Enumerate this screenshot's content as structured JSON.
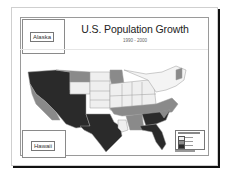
{
  "map": {
    "title": "U.S. Population Growth",
    "subtitle": "1990 - 2000",
    "insets": [
      {
        "label": "Alaska"
      },
      {
        "label": "Hawaii"
      }
    ],
    "legend": {
      "title": "Population Growth",
      "classes": [
        {
          "label": "class 1",
          "color": "#f0f0f0"
        },
        {
          "label": "class 2",
          "color": "#8c8c8c"
        },
        {
          "label": "class 3",
          "color": "#2b2b2b"
        }
      ]
    },
    "colors": {
      "low": "#efefef",
      "medium": "#8a8a8a",
      "high": "#2a2a2a",
      "state_border": "#9a9a9a"
    }
  }
}
